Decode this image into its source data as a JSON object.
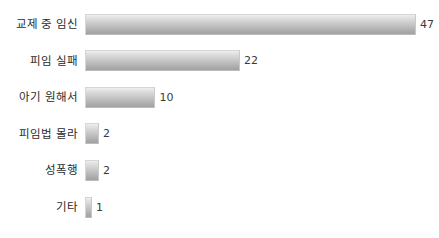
{
  "chart_data": {
    "type": "bar",
    "orientation": "horizontal",
    "title": "",
    "subtitle": "",
    "xlabel": "",
    "ylabel": "",
    "grid": false,
    "legend": null,
    "xlim": [
      0,
      47
    ],
    "categories": [
      "교제 중 임신",
      "피임 실패",
      "아기 원해서",
      "피임법 몰라",
      "성폭행",
      "기타"
    ],
    "values": [
      47,
      22,
      10,
      2,
      2,
      1
    ],
    "value_labels": [
      "47",
      "22",
      "10",
      "2",
      "2",
      "1"
    ],
    "bars": [
      {
        "label": "교제 중 임신",
        "value": 47,
        "value_label": "47"
      },
      {
        "label": "피임 실패",
        "value": 22,
        "value_label": "22"
      },
      {
        "label": "아기 원해서",
        "value": 10,
        "value_label": "10"
      },
      {
        "label": "피임법 몰라",
        "value": 2,
        "value_label": "2"
      },
      {
        "label": "성폭행",
        "value": 2,
        "value_label": "2"
      },
      {
        "label": "기타",
        "value": 1,
        "value_label": "1"
      }
    ]
  },
  "style": {
    "background": "#ffffff",
    "bar_top_color": "#efefef",
    "bar_bottom_color": "#a2a2a2",
    "bar_border_color": "#d6d6d6",
    "label_color": "#2b2b2b",
    "value_color": "#3a3a3a"
  },
  "layout": {
    "bar_start_x": 85,
    "bar_max_width": 331,
    "row_pitch": 36.6,
    "first_row_top": 13,
    "bar_height": 21,
    "min_bar_width": 6
  }
}
